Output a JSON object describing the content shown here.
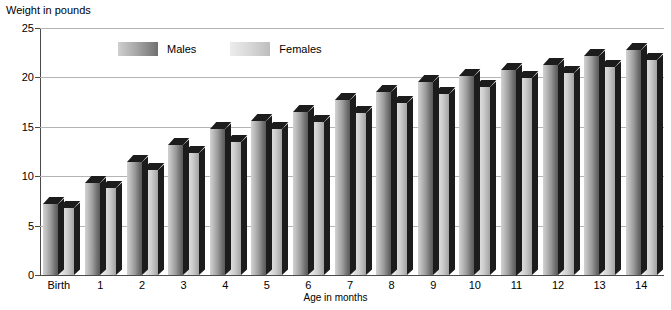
{
  "chart_data": {
    "type": "bar",
    "title": "",
    "ylabel": "Weight in pounds",
    "xlabel": "Age in months",
    "ylim": [
      0,
      25
    ],
    "yticks": [
      0,
      5,
      10,
      15,
      20,
      25
    ],
    "grid": true,
    "legend_position": "top-left-inside",
    "categories": [
      "Birth",
      "1",
      "2",
      "3",
      "4",
      "5",
      "6",
      "7",
      "8",
      "9",
      "10",
      "11",
      "12",
      "13",
      "14"
    ],
    "series": [
      {
        "name": "Males",
        "color": "#6e6e6e",
        "values": [
          7.2,
          9.3,
          11.4,
          13.2,
          14.8,
          15.6,
          16.5,
          17.7,
          18.5,
          19.5,
          20.1,
          20.8,
          21.3,
          22.2,
          22.8
        ]
      },
      {
        "name": "Females",
        "color": "#c4c4c4",
        "values": [
          6.8,
          8.8,
          10.6,
          12.3,
          13.5,
          14.8,
          15.5,
          16.4,
          17.4,
          18.3,
          19.0,
          19.9,
          20.4,
          21.1,
          21.8
        ]
      }
    ]
  },
  "axes": {
    "y_title": "Weight in pounds",
    "x_title": "Age in months"
  },
  "legend": {
    "items": [
      {
        "label": "Males",
        "swatch": "male-swatch"
      },
      {
        "label": "Females",
        "swatch": "female-swatch"
      }
    ]
  },
  "colors": {
    "gridline": "#b4b4b4",
    "axis": "#4a4a4a",
    "bar_cap": "#1c1c1c",
    "background": "#ffffff"
  }
}
